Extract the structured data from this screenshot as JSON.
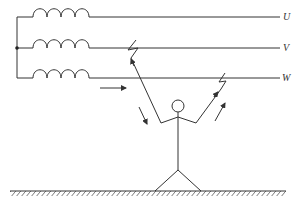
{
  "diagram": {
    "type": "two-phase electric shock schematic",
    "phases": [
      {
        "id": "U",
        "label": "U",
        "y": 17
      },
      {
        "id": "V",
        "label": "V",
        "y": 48
      },
      {
        "id": "W",
        "label": "W",
        "y": 78
      }
    ],
    "components": {
      "transformer_windings": 3,
      "neutral_junction": "star point on left bus",
      "person": "stick figure standing on ground, left hand touching phase V, right hand touching phase W",
      "ground": "hatched earth line"
    },
    "current_arrows": [
      {
        "name": "current-arrow-horizontal",
        "direction": "right"
      },
      {
        "name": "current-arrow-left-arm",
        "direction": "down-right"
      },
      {
        "name": "current-arrow-right-arm",
        "direction": "up-right"
      }
    ],
    "colors": {
      "line": "#333333",
      "background": "#ffffff"
    }
  }
}
